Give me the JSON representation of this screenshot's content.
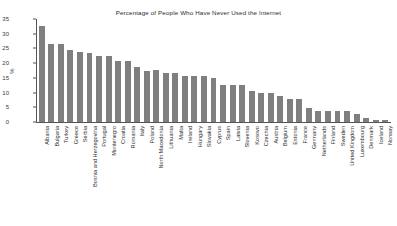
{
  "chart_data": {
    "type": "bar",
    "title": "Percentage of People Who Have Never Used the Internet",
    "xlabel": "",
    "ylabel": "%",
    "ylim": [
      0,
      35
    ],
    "yticks": [
      0,
      5,
      10,
      15,
      20,
      25,
      30,
      35
    ],
    "grid": false,
    "legend": "none",
    "bar_color": "#7f7f7f",
    "categories": [
      "Albania",
      "Bulgaria",
      "Turkey",
      "Greece",
      "Serbia",
      "Bosnia and Herzegovina",
      "Portugal",
      "Montenegro",
      "Croatia",
      "Romania",
      "Italy",
      "Poland",
      "North Macedonia",
      "Lithuania",
      "Malta",
      "Ireland",
      "Hungary",
      "Slovakia",
      "Cyprus",
      "Spain",
      "Latvia",
      "Slovenia",
      "Kosovo",
      "Czechia",
      "Austria",
      "Belgium",
      "Estonia",
      "France",
      "Germany",
      "Netherlands",
      "Finland",
      "Sweden",
      "United Kingdom",
      "Luxembourg",
      "Denmark",
      "Iceland",
      "Norway"
    ],
    "values": [
      32.5,
      26.4,
      26.6,
      24.6,
      23.7,
      23.6,
      22.6,
      22.6,
      20.7,
      20.6,
      18.6,
      17.5,
      17.6,
      16.7,
      16.7,
      15.7,
      15.7,
      15.7,
      14.8,
      12.7,
      12.7,
      12.7,
      10.7,
      9.9,
      9.8,
      8.8,
      7.9,
      7.9,
      4.8,
      3.7,
      3.7,
      3.7,
      3.7,
      2.8,
      1.4,
      0.6,
      0.6
    ]
  }
}
